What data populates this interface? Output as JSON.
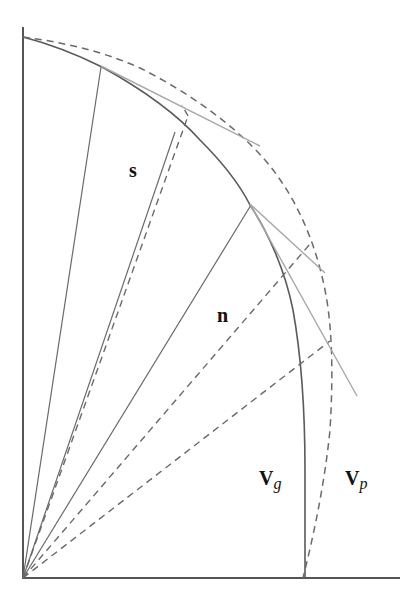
{
  "labels": {
    "s": "s",
    "n": "n",
    "vg_main": "V",
    "vg_sub": "g",
    "vp_main": "V",
    "vp_sub": "p"
  },
  "curves": {
    "group_velocity": "solid curve (V_g)",
    "phase_velocity": "dashed curve (V_p)"
  },
  "rays": {
    "solid_count": 3,
    "dashed_count": 3
  },
  "tangent_lines": 3,
  "colors": {
    "axis": "#555555",
    "solid": "#5a5a5a",
    "dashed": "#6a6a6a",
    "tangent": "#a8a8a8",
    "label": "#111111"
  }
}
